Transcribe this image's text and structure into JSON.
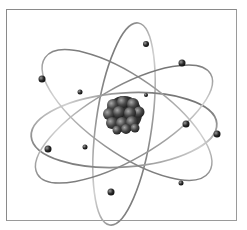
{
  "figure": {
    "caption": "",
    "colors": {
      "background": "#ffffff",
      "frame": "#8a8a8a",
      "orbit": "#6e6e6e",
      "orbit_light": "#c8c8c8",
      "electron": "#2a2a2a",
      "nucleus_dark": "#2e2e2e",
      "nucleus_highlight": "#9a9a9a"
    },
    "nucleus": {
      "cx": 124,
      "cy": 114,
      "r": 18,
      "particle_count": 18
    },
    "orbits": [
      {
        "name": "vertical-orbit",
        "cx": 124,
        "cy": 124,
        "rx": 28,
        "ry": 102,
        "rotate": 8
      },
      {
        "name": "horizontal-orbit",
        "cx": 124,
        "cy": 130,
        "rx": 93,
        "ry": 37,
        "rotate": -4
      },
      {
        "name": "diagonal-orbit-left",
        "cx": 127,
        "cy": 115,
        "rx": 100,
        "ry": 38,
        "rotate": 35
      },
      {
        "name": "diagonal-orbit-right",
        "cx": 124,
        "cy": 124,
        "rx": 100,
        "ry": 36,
        "rotate": -30
      }
    ],
    "electrons": [
      {
        "x": 42,
        "y": 79,
        "r": 3.5
      },
      {
        "x": 80,
        "y": 92,
        "r": 2.5
      },
      {
        "x": 146,
        "y": 44,
        "r": 3
      },
      {
        "x": 182,
        "y": 63,
        "r": 3.5
      },
      {
        "x": 146,
        "y": 95,
        "r": 2
      },
      {
        "x": 186,
        "y": 124,
        "r": 3.5
      },
      {
        "x": 217,
        "y": 134,
        "r": 3.5
      },
      {
        "x": 48,
        "y": 149,
        "r": 3.5
      },
      {
        "x": 85,
        "y": 147,
        "r": 2.5
      },
      {
        "x": 111,
        "y": 192,
        "r": 3.5
      },
      {
        "x": 181,
        "y": 183,
        "r": 2.5
      }
    ]
  }
}
